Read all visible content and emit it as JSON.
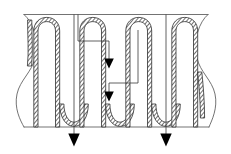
{
  "figure": {
    "description": "Cut-away cross-section of a meandering serpentine tube or cooling channel embedded in a plate, with hatched tube walls, wavy break lines at the left and right edges, and downward flow arrows.",
    "background_color": "#ffffff",
    "stroke_color": "#5a5a5a",
    "wall_stroke_color": "#2e2e2e",
    "arrow_color": "#000000",
    "leader_color": "#3a3a3a"
  },
  "canvas": {
    "width": 231,
    "height": 154
  },
  "plate": {
    "top_boundary_y": 14.5,
    "bottom_boundary_y": 127.0,
    "left_boundary_x": 22.0,
    "right_boundary_x": 209.0,
    "break_edge_style": "wavy-s-curve"
  },
  "channel": {
    "shape": "serpentine",
    "wall_fill": "diagonal-hatch",
    "wall_thickness": 4.2,
    "bore_width": 11.5,
    "pass_count": 6,
    "top_bend_y": 20.0,
    "bottom_bend_y": 124.0,
    "leg_center_x": [
      38.0,
      55.5,
      84.0,
      101.5,
      130.0,
      147.5,
      176.0,
      193.5
    ],
    "bend_type_top": "narrow-arch",
    "bend_type_bottom": "round-u"
  },
  "arrows": [
    {
      "name": "flow-arrow-upper-inner",
      "direction": "down",
      "size": "small",
      "tip_x": 109.0,
      "tip_y": 68.0,
      "leader_from": "horizontal-tick-left"
    },
    {
      "name": "flow-arrow-lower-inner",
      "direction": "down",
      "size": "small",
      "tip_x": 109.0,
      "tip_y": 101.0,
      "leader_from": "horizontal-tick-right"
    },
    {
      "name": "flow-arrow-left-outer",
      "direction": "down",
      "size": "large",
      "tip_x": 74.0,
      "tip_y": 146.0,
      "leader_from": "top-boundary"
    },
    {
      "name": "flow-arrow-right-outer",
      "direction": "down",
      "size": "large",
      "tip_x": 166.0,
      "tip_y": 146.0,
      "leader_from": "top-boundary"
    }
  ],
  "leaders": {
    "upper_horizontal_y": 41.0,
    "upper_horizontal_x1": 78.0,
    "upper_horizontal_x2": 109.0,
    "lower_horizontal_y": 83.0,
    "lower_horizontal_x1": 109.0,
    "lower_horizontal_x2": 138.0,
    "upper_vertical_origin_x": 78.0,
    "upper_vertical_origin_y": 14.5,
    "lower_vertical_origin_x": 138.0,
    "lower_vertical_origin_y": 30.0
  },
  "labels": {
    "none_visible": ""
  }
}
